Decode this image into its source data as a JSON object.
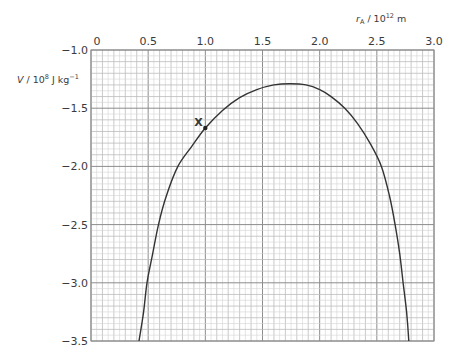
{
  "chart_data": {
    "type": "line",
    "title": "",
    "xlabel": "r_A / 10^12 m",
    "xlabel_parts": {
      "symbol": "r",
      "subscript": "A",
      "unit_prefix": " / 10",
      "exponent": "12",
      "unit": " m"
    },
    "ylabel": "V / 10^8 J kg^-1",
    "ylabel_parts": {
      "symbol": "V",
      "unit_prefix": " / 10",
      "exponent": "8",
      "unit": " J kg",
      "unit_exponent": "−1"
    },
    "xlim": [
      0,
      3.0
    ],
    "ylim": [
      -3.5,
      -1.0
    ],
    "x_ticks": [
      "0",
      "0.5",
      "1.0",
      "1.5",
      "2.0",
      "2.5",
      "3.0"
    ],
    "y_ticks": [
      "−1.0",
      "−1.5",
      "−2.0",
      "−2.5",
      "−3.0",
      "−3.5"
    ],
    "x_axis_position": "top",
    "grid": {
      "major": 0.5,
      "minor_x": 0.1,
      "minor_y": 0.1,
      "fine_x": 0.05,
      "fine_y": 0.05
    },
    "series": [
      {
        "name": "V vs r_A",
        "x": [
          0.42,
          0.46,
          0.49,
          0.54,
          0.59,
          0.66,
          0.76,
          0.88,
          1.0,
          1.15,
          1.3,
          1.45,
          1.6,
          1.74,
          1.88,
          2.0,
          2.1,
          2.22,
          2.33,
          2.44,
          2.54,
          2.61,
          2.66,
          2.7,
          2.73,
          2.76,
          2.78
        ],
        "y": [
          -3.5,
          -3.25,
          -3.0,
          -2.75,
          -2.5,
          -2.25,
          -2.0,
          -1.83,
          -1.67,
          -1.52,
          -1.41,
          -1.34,
          -1.3,
          -1.29,
          -1.3,
          -1.34,
          -1.4,
          -1.5,
          -1.63,
          -1.8,
          -2.0,
          -2.25,
          -2.5,
          -2.75,
          -3.0,
          -3.25,
          -3.5
        ]
      }
    ],
    "annotations": [
      {
        "label": "X",
        "x": 1.0,
        "y": -1.67,
        "marker": "dot"
      }
    ]
  },
  "labels": {
    "x_symbol": "r",
    "x_sub": "A",
    "x_rest": " / 10",
    "x_exp": "12",
    "x_unit": " m",
    "y_symbol": "V",
    "y_rest": " / 10",
    "y_exp": "8",
    "y_unit": " J kg",
    "y_unit_exp": "−1",
    "point_label": "X"
  }
}
